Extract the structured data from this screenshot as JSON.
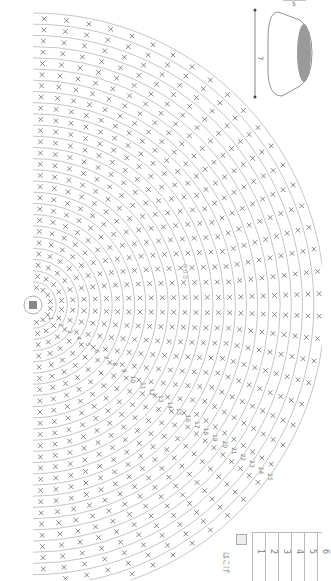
{
  "chart_title": "Crochet bowl pattern chart",
  "rotation": "90deg clockwise",
  "center_label": "magic ring",
  "rounds": [
    "1",
    "2",
    "3",
    "4",
    "5",
    "6",
    "7",
    "8",
    "9",
    "10",
    "11",
    "12",
    "13",
    "14",
    "15",
    "16",
    "17",
    "18",
    "19",
    "20",
    "21",
    "22",
    "23",
    "24",
    "25"
  ],
  "rounds_count": 25,
  "start_mark": "0",
  "dimensions": {
    "height_label": "7",
    "width_label": "5"
  },
  "legend": {
    "rows": [
      "1",
      "2",
      "3",
      "4",
      "5",
      "6"
    ],
    "note": "はこげ"
  },
  "side_caption": "0.0.0",
  "colors": {
    "line": "#b0b0b0",
    "stitch": "#666666",
    "bowl_fill": "#9a9a9a"
  }
}
